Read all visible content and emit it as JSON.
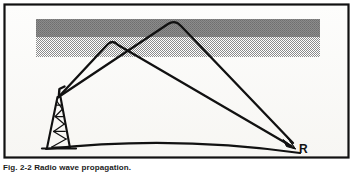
{
  "figure": {
    "caption": "Fig. 2-2  Radio wave propagation.",
    "frame": {
      "border_color": "#111111",
      "background_color": "#ffffff",
      "outer_inset": 3,
      "border_width": 2
    },
    "labels": {
      "receiver": "R"
    },
    "colors": {
      "ink": "#111111",
      "paper": "#ffffff",
      "ionosphere_upper": "#8f8f8f",
      "ionosphere_lower": "#a8a8a8",
      "scan_tint": "#f2f1ee"
    },
    "ionosphere": {
      "name": "ionosphere-band",
      "x": 36,
      "y": 19,
      "width": 284,
      "height": 38,
      "upper_layer_height": 18,
      "lower_layer_height": 20
    },
    "transmitter": {
      "name": "transmitter-tower",
      "apex_x": 58,
      "apex_y": 97,
      "base_left_x": 44,
      "base_right_x": 72,
      "base_y": 148
    },
    "receiver": {
      "name": "receiver-point",
      "x": 295,
      "y": 149,
      "label_x": 300,
      "label_y": 150
    },
    "earth": {
      "name": "earth-surface-curve",
      "start_x": 46,
      "start_y": 149,
      "peak_x": 170,
      "peak_y": 141,
      "end_x": 300,
      "end_y": 153
    },
    "rays": [
      {
        "name": "ray-lower-hop",
        "apex_x": 113,
        "apex_y": 40,
        "reflects_in": "lower-layer"
      },
      {
        "name": "ray-upper-hop",
        "apex_x": 175,
        "apex_y": 21,
        "reflects_in": "upper-layer"
      }
    ]
  }
}
